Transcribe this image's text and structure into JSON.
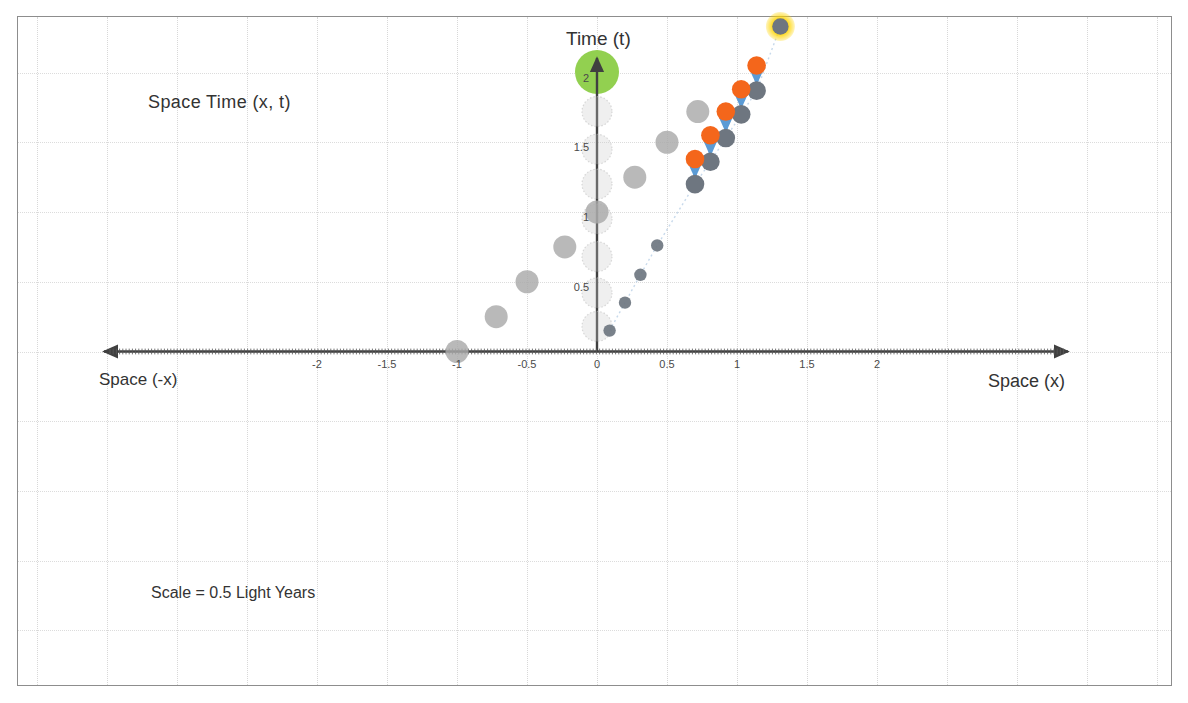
{
  "figure": {
    "title_annotation": "Space  Time  (x, t)",
    "scale_note": "Scale = 0.5 Light Years",
    "axis_labels": {
      "y_top": "Time (t)",
      "x_right": "Space (x)",
      "x_left": "Space (-x)"
    }
  },
  "chart_data": {
    "type": "scatter",
    "title": "Space  Time  (x, t)",
    "xlabel": "Space (x)",
    "ylabel": "Time (t)",
    "xlim": [
      -2.45,
      2.85
    ],
    "ylim": [
      -1.3,
      2.25
    ],
    "grid": true,
    "legend": "none",
    "annotations": [
      "Space  Time  (x, t)",
      "Scale = 0.5 Light Years",
      "Space (-x)",
      "Space (x)",
      "Time (t)"
    ],
    "xticks": [
      -2,
      -1.5,
      -1,
      -0.5,
      0,
      0.5,
      1,
      1.5,
      2
    ],
    "xticklabels": [
      "-2",
      "-1.5",
      "-1",
      "-0.5",
      "0",
      "0.5",
      "1",
      "1.5",
      "2"
    ],
    "yticks": [
      0,
      0.5,
      1,
      1.5,
      2
    ],
    "yticklabels": [
      "0",
      "0.5",
      "1",
      "1.5",
      "2"
    ],
    "series": [
      {
        "name": "left-ghost-worldline",
        "style": "light-gray-dots",
        "color": "#a8a8a8",
        "points": [
          {
            "x": -1.0,
            "y": 0.0
          },
          {
            "x": -0.72,
            "y": 0.25
          },
          {
            "x": -0.5,
            "y": 0.5
          },
          {
            "x": -0.23,
            "y": 0.75
          },
          {
            "x": 0.0,
            "y": 1.0
          },
          {
            "x": 0.27,
            "y": 1.25
          },
          {
            "x": 0.5,
            "y": 1.5
          },
          {
            "x": 0.72,
            "y": 1.72
          }
        ]
      },
      {
        "name": "axis-ghost-column",
        "style": "faint-gray-dots",
        "color": "#d9d9d9",
        "points": [
          {
            "x": 0.0,
            "y": 0.18
          },
          {
            "x": 0.0,
            "y": 0.42
          },
          {
            "x": 0.0,
            "y": 0.68
          },
          {
            "x": 0.0,
            "y": 0.95
          },
          {
            "x": 0.0,
            "y": 1.2
          },
          {
            "x": 0.0,
            "y": 1.45
          },
          {
            "x": 0.0,
            "y": 1.72
          }
        ]
      },
      {
        "name": "right-observer-trail",
        "style": "dark-gray-small-dots",
        "color": "#6e7680",
        "points": [
          {
            "x": 0.09,
            "y": 0.15
          },
          {
            "x": 0.2,
            "y": 0.35
          },
          {
            "x": 0.31,
            "y": 0.55
          },
          {
            "x": 0.43,
            "y": 0.76
          }
        ]
      },
      {
        "name": "emission-events-orange",
        "style": "orange-dots",
        "color": "#f4661b",
        "points": [
          {
            "x": 0.7,
            "y": 1.38
          },
          {
            "x": 0.81,
            "y": 1.55
          },
          {
            "x": 0.92,
            "y": 1.72
          },
          {
            "x": 1.03,
            "y": 1.88
          },
          {
            "x": 1.14,
            "y": 2.05
          }
        ]
      },
      {
        "name": "reception-events-gray",
        "style": "gray-dots",
        "color": "#6e7680",
        "points": [
          {
            "x": 0.7,
            "y": 1.2
          },
          {
            "x": 0.81,
            "y": 1.36
          },
          {
            "x": 0.92,
            "y": 1.53
          },
          {
            "x": 1.03,
            "y": 1.7
          },
          {
            "x": 1.14,
            "y": 1.87
          }
        ]
      },
      {
        "name": "light-signal-arrows",
        "style": "blue-down-arrows",
        "color": "#5b9bd5",
        "arrows": [
          {
            "x": 0.7,
            "y0": 1.38,
            "y1": 1.2
          },
          {
            "x": 0.81,
            "y0": 1.55,
            "y1": 1.36
          },
          {
            "x": 0.92,
            "y0": 1.72,
            "y1": 1.53
          },
          {
            "x": 1.03,
            "y0": 1.88,
            "y1": 1.7
          },
          {
            "x": 1.14,
            "y0": 2.05,
            "y1": 1.87
          }
        ]
      },
      {
        "name": "highlighted-event",
        "style": "yellow-halo-gray-dot",
        "color": "#6e7680",
        "halo_color": "#ffd500",
        "points": [
          {
            "x": 1.31,
            "y": 2.33
          }
        ]
      },
      {
        "name": "origin-marker",
        "style": "green-circle",
        "color": "#92d050",
        "points": [
          {
            "x": 0.0,
            "y": 2.0
          }
        ]
      }
    ]
  }
}
